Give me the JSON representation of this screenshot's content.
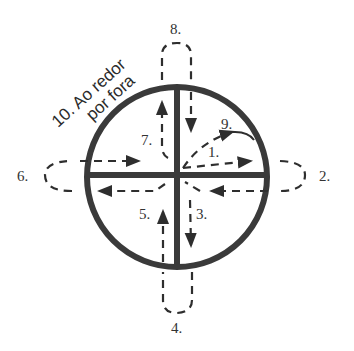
{
  "diagram": {
    "colors": {
      "stroke": "#3a3a3a",
      "dash": "#2e2e2e",
      "background": "#ffffff"
    },
    "labels": {
      "step1": "1.",
      "step2": "2.",
      "step3": "3.",
      "step4": "4.",
      "step5": "5.",
      "step6": "6.",
      "step7": "7.",
      "step8": "8.",
      "step9": "9.",
      "step10_line1": "10. Ao redor",
      "step10_line2": "por fora"
    },
    "bottom_caption_partial": "11. ..."
  }
}
